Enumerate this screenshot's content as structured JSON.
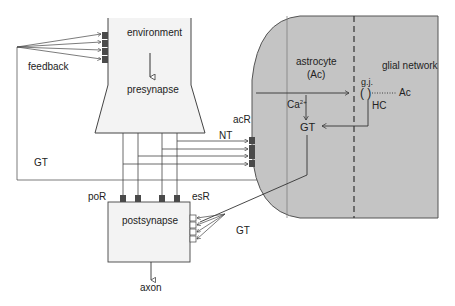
{
  "diagram": {
    "labels": {
      "environment": "environment",
      "presynapse": "presynapse",
      "feedback": "feedback",
      "astrocyte": "astrocyte",
      "astrocyte_abbr": "(Ac)",
      "glial_network": "glial network",
      "gap_junction": "g.j.",
      "hemichannel": "HC",
      "ac": "Ac",
      "calcium": "Ca",
      "calcium_charge": "2+",
      "gt_astro": "GT",
      "acr": "acR",
      "nt": "NT",
      "gt_feedback": "GT",
      "por": "poR",
      "esr": "esR",
      "postsynapse": "postsynapse",
      "gt_post": "GT",
      "axon": "axon"
    },
    "colors": {
      "astrocyte_fill": "#c4c4c4",
      "compartment_fill": "#f3f3f3",
      "receptor_fill": "#4a4a4a",
      "line": "#333333"
    }
  }
}
